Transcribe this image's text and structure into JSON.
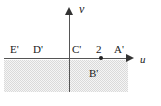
{
  "figure": {
    "axes": {
      "horizontal_label": "u",
      "vertical_label": "ν"
    },
    "tick_labels": [
      {
        "name": "tick-2",
        "text": "2"
      }
    ],
    "point_labels": [
      {
        "name": "label-E-prime",
        "text": "E'"
      },
      {
        "name": "label-D-prime",
        "text": "D'"
      },
      {
        "name": "label-C-prime",
        "text": "C'"
      },
      {
        "name": "label-A-prime",
        "text": "A'"
      },
      {
        "name": "label-B-prime",
        "text": "B'"
      }
    ],
    "labels": {
      "E_prime": "E'",
      "D_prime": "D'",
      "C_prime": "C'",
      "two": "2",
      "A_prime": "A'",
      "B_prime": "B'",
      "u": "u",
      "nu": "ν"
    },
    "colors": {
      "axis": "#555555",
      "arrow": "#333333",
      "text": "#1a1a1a",
      "shading": "#d9d9d9",
      "point": "#222222",
      "background": "#ffffff"
    },
    "region": {
      "name": "shaded-lower-half-plane",
      "description": "shaded"
    }
  }
}
